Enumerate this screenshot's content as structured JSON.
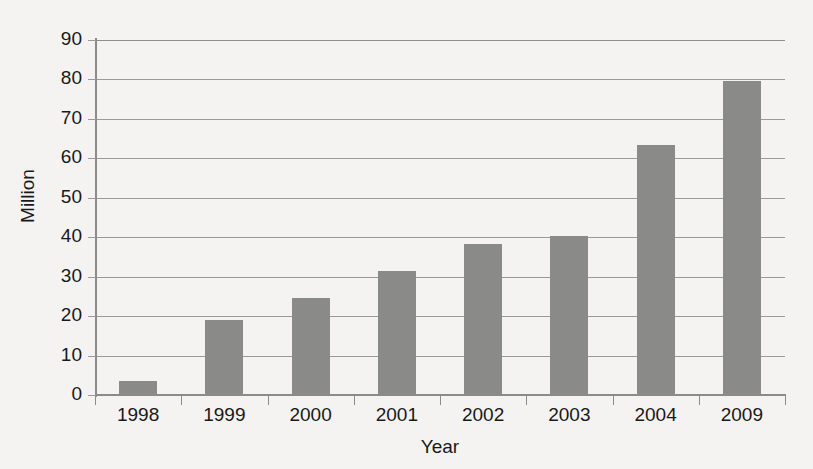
{
  "chart_data": {
    "type": "bar",
    "title": "",
    "xlabel": "Year",
    "ylabel": "Million",
    "categories": [
      "1998",
      "1999",
      "2000",
      "2001",
      "2002",
      "2003",
      "2004",
      "2009"
    ],
    "values": [
      3.5,
      19,
      24.7,
      31.5,
      38.3,
      40.2,
      63.5,
      79.5
    ],
    "ylim": [
      0,
      90
    ],
    "ytick_labels": [
      "90",
      "80",
      "70",
      "60",
      "50",
      "40",
      "30",
      "20",
      "10",
      "0"
    ],
    "ytick_values": [
      90,
      80,
      70,
      60,
      50,
      40,
      30,
      20,
      10,
      0
    ],
    "ytick_interval": 10,
    "grid": true,
    "legend": false,
    "bar_color": "#8a8a88",
    "gridline_color": "#9a9a98",
    "axis_color": "#8b8b89",
    "background_color": "#f4f3f1",
    "text_color": "#19191a"
  }
}
